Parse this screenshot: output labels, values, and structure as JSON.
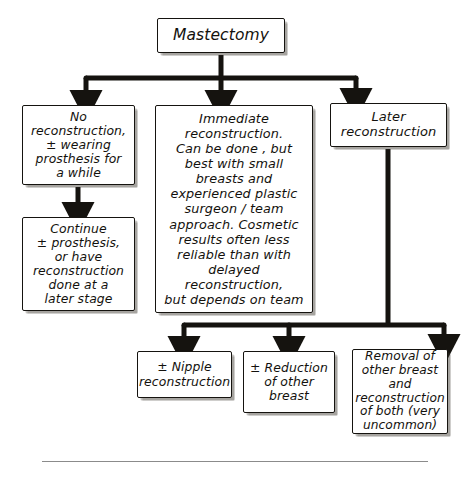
{
  "figure": {
    "type": "flowchart",
    "root": {
      "id": "mastectomy",
      "label": "Mastectomy"
    },
    "level_one": [
      {
        "id": "no-reconstruction",
        "label": "No\nreconstruction,\n± wearing\nprosthesis for\na while"
      },
      {
        "id": "immediate-reconstruction",
        "label": "Immediate\nreconstruction.\nCan be done , but\nbest with small\nbreasts and\nexperienced plastic\nsurgeon / team\napproach. Cosmetic\nresults often less\nreliable than with\ndelayed reconstruction,\nbut depends on team"
      },
      {
        "id": "later-reconstruction",
        "label": "Later\nreconstruction"
      }
    ],
    "level_two": [
      {
        "id": "continue-prosthesis",
        "label": "Continue\n± prosthesis,\nor have\nreconstruction\ndone at a\nlater stage"
      }
    ],
    "level_three": [
      {
        "id": "nipple-reconstruction",
        "label": "± Nipple\nreconstruction"
      },
      {
        "id": "reduction-other-breast",
        "label": "± Reduction\nof other\nbreast"
      },
      {
        "id": "removal-other-breast",
        "label": "Removal of\nother breast\nand\nreconstruction\nof both (very\nuncommon)"
      }
    ],
    "edges": [
      {
        "from": "mastectomy",
        "to": "no-reconstruction"
      },
      {
        "from": "mastectomy",
        "to": "immediate-reconstruction"
      },
      {
        "from": "mastectomy",
        "to": "later-reconstruction"
      },
      {
        "from": "no-reconstruction",
        "to": "continue-prosthesis"
      },
      {
        "from": "later-reconstruction",
        "to": "nipple-reconstruction"
      },
      {
        "from": "later-reconstruction",
        "to": "reduction-other-breast"
      },
      {
        "from": "later-reconstruction",
        "to": "removal-other-breast"
      }
    ],
    "colors": {
      "ink": "#15130f",
      "paper": "#ffffff",
      "shadow": "#3c372d",
      "rule": "#8b8b8b"
    }
  }
}
